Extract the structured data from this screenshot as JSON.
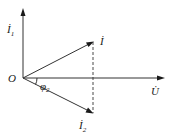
{
  "diagram": {
    "type": "phasor-diagram",
    "origin": {
      "label": "O",
      "x": 23,
      "y": 78
    },
    "colors": {
      "line": "#333333",
      "text": "#1a1a1a",
      "background": "#ffffff"
    },
    "vectors": [
      {
        "id": "I1",
        "label": "İ",
        "subscript": "1",
        "from": [
          23,
          78
        ],
        "to": [
          23,
          10
        ],
        "style": "solid"
      },
      {
        "id": "U",
        "label": "U̇",
        "subscript": "",
        "from": [
          23,
          78
        ],
        "to": [
          162,
          78
        ],
        "style": "solid"
      },
      {
        "id": "I",
        "label": "İ",
        "subscript": "",
        "from": [
          23,
          78
        ],
        "to": [
          93,
          42
        ],
        "style": "solid"
      },
      {
        "id": "I2",
        "label": "İ",
        "subscript": "2",
        "from": [
          23,
          78
        ],
        "to": [
          93,
          113
        ],
        "style": "solid"
      }
    ],
    "projection": {
      "from": [
        93,
        42
      ],
      "to": [
        93,
        113
      ],
      "style": "dashed"
    },
    "angle": {
      "label": "φ",
      "subscript": "2",
      "between": [
        "U",
        "I2"
      ]
    }
  }
}
